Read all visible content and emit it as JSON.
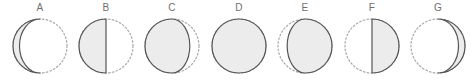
{
  "figure": {
    "width": 476,
    "height": 81,
    "background": "#ffffff",
    "kind": "moon-phase-sequence",
    "panel_count": 7
  },
  "style": {
    "lit_fill": "#ececec",
    "lit_stroke": "#555555",
    "dark_stroke": "#a8a8a8",
    "label_color": "#6e6e6e",
    "stroke_width": 1.2,
    "dash_pattern": "1.6 2.2"
  },
  "geometry": {
    "radius": 27,
    "center_y": 32,
    "center_x": 33,
    "panel_width": 66,
    "panel_spacing": 66.5,
    "first_panel_left": 7
  },
  "chart_data": {
    "type": "diagram",
    "title": "",
    "series_name": "lunar phase illumination sequence",
    "categories": [
      "A",
      "B",
      "C",
      "D",
      "E",
      "F",
      "G"
    ],
    "values": [
      0.12,
      0.5,
      0.83,
      1.0,
      0.83,
      0.5,
      0.12
    ],
    "ylabel": "illuminated fraction",
    "xlabel": ""
  },
  "panels": [
    {
      "label": "A",
      "left": 7,
      "lit_side": "left",
      "illuminated_fraction": 0.12,
      "terminator_curvature": -0.76,
      "phase_name": "thin left crescent"
    },
    {
      "label": "B",
      "left": 73,
      "lit_side": "left",
      "illuminated_fraction": 0.5,
      "terminator_curvature": 0,
      "phase_name": "left half lit"
    },
    {
      "label": "C",
      "left": 139,
      "lit_side": "left",
      "illuminated_fraction": 0.83,
      "terminator_curvature": 0.66,
      "phase_name": "left gibbous"
    },
    {
      "label": "D",
      "left": 206,
      "lit_side": "left",
      "illuminated_fraction": 1,
      "terminator_curvature": 1,
      "phase_name": "fully lit"
    },
    {
      "label": "E",
      "left": 272,
      "lit_side": "right",
      "illuminated_fraction": 0.83,
      "terminator_curvature": 0.66,
      "phase_name": "right gibbous"
    },
    {
      "label": "F",
      "left": 339,
      "lit_side": "right",
      "illuminated_fraction": 0.5,
      "terminator_curvature": 0,
      "phase_name": "right half lit"
    },
    {
      "label": "G",
      "left": 405,
      "lit_side": "right",
      "illuminated_fraction": 0.12,
      "terminator_curvature": -0.76,
      "phase_name": "thin right crescent"
    }
  ]
}
